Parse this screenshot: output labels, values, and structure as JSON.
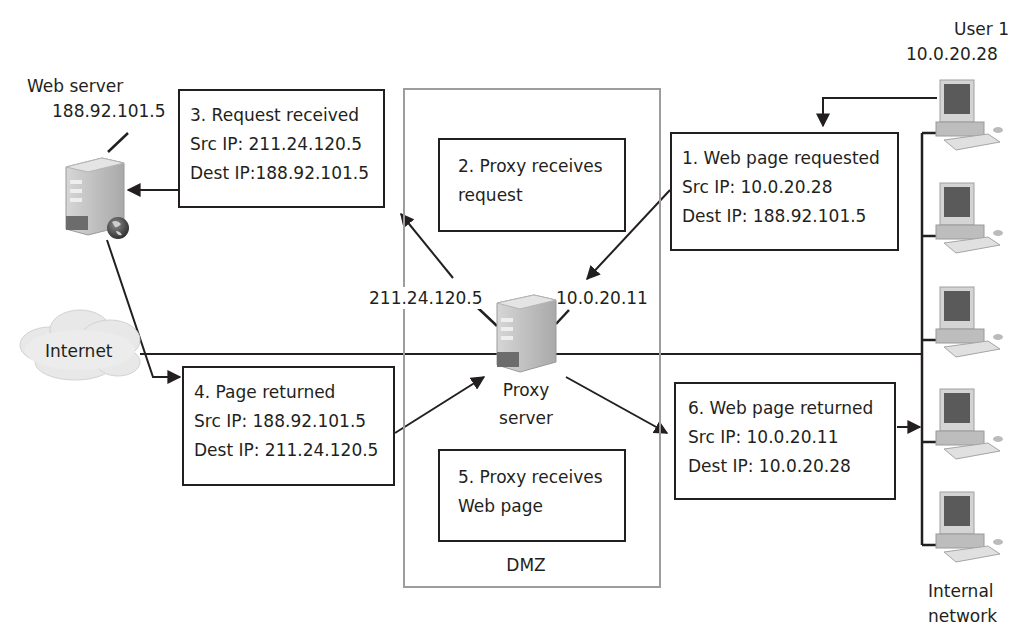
{
  "diagram": {
    "colors": {
      "line": "#231f20",
      "dmz_border": "#9d9d9d",
      "device_body": "#c9c9c9",
      "cloud": "#e6e6e6",
      "background": "#ffffff"
    },
    "nodes": {
      "web_server": {
        "label": "Web server",
        "ip": "188.92.101.5",
        "icon": "server-globe-icon"
      },
      "internet": {
        "label": "Internet",
        "icon": "cloud-icon"
      },
      "proxy_server": {
        "label_line1": "Proxy",
        "label_line2": "server",
        "icon": "server-icon",
        "external_ip": "211.24.120.5",
        "internal_ip": "10.0.20.11"
      },
      "dmz": {
        "label": "DMZ"
      },
      "user1": {
        "label": "User 1",
        "ip": "10.0.20.28",
        "icon": "workstation-icon"
      },
      "internal_network": {
        "label_line1": "Internal",
        "label_line2": "network",
        "workstation_count": 5
      }
    },
    "steps": [
      {
        "id": 1,
        "title": "1. Web page requested",
        "src": "Src IP: 10.0.20.28",
        "dest": "Dest IP: 188.92.101.5"
      },
      {
        "id": 2,
        "title": "2. Proxy receives",
        "title2": "request"
      },
      {
        "id": 3,
        "title": "3. Request received",
        "src": "Src IP: 211.24.120.5",
        "dest": "Dest IP:188.92.101.5"
      },
      {
        "id": 4,
        "title": "4. Page returned",
        "src": "Src IP: 188.92.101.5",
        "dest": "Dest IP: 211.24.120.5"
      },
      {
        "id": 5,
        "title": "5. Proxy receives",
        "title2": "Web page"
      },
      {
        "id": 6,
        "title": "6. Web page returned",
        "src": "Src IP: 10.0.20.11",
        "dest": "Dest IP: 10.0.20.28"
      }
    ]
  }
}
